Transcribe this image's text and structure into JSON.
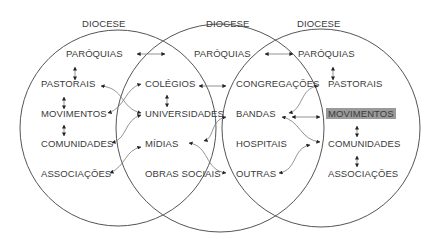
{
  "diagram": {
    "title_labels": [
      "DIOCESE",
      "DIOCESE",
      "DIOCESE"
    ],
    "circles": [
      {
        "name": "left",
        "title": "DIOCESE",
        "items": [
          "PARÓQUIAS",
          "PASTORAIS",
          "MOVIMENTOS",
          "COMUNIDADES",
          "ASSOCIAÇÕES"
        ]
      },
      {
        "name": "middle",
        "title": "DIOCESE",
        "items": [
          "PARÓQUIAS",
          "COLÉGIOS",
          "UNIVERSIDADES",
          "MÍDIAS",
          "OBRAS SOCIAIS"
        ]
      },
      {
        "name": "right",
        "title": "DIOCESE",
        "items": [
          "PARÓQUIAS",
          "PASTORAIS",
          "MOVIMENTOS",
          "COMUNIDADES",
          "ASSOCIAÇÕES"
        ],
        "highlighted_item": "MOVIMENTOS"
      }
    ],
    "overlap_middle_right": {
      "items": [
        "CONGREGAÇÕES",
        "BANDAS",
        "HOSPITAIS",
        "OUTRAS"
      ]
    },
    "colors": {
      "circle_stroke": "#555555",
      "arrow_stroke": "#777777",
      "text": "#3a3a3a",
      "highlight_bg": "#9a9a9a"
    }
  }
}
